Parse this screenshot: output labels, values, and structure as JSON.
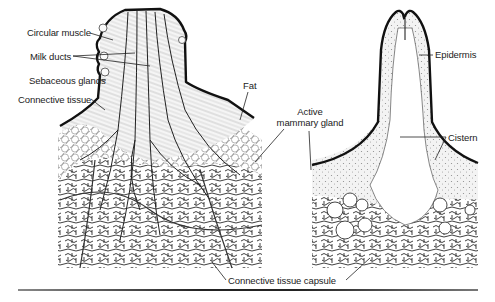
{
  "figure": {
    "left_panel": {
      "title": "Udder with teat (cross-section)",
      "labels": [
        {
          "id": "circular-muscle",
          "text": "Circular muscle",
          "x": 27,
          "y": 27
        },
        {
          "id": "milk-ducts",
          "text": "Milk ducts",
          "x": 30,
          "y": 51
        },
        {
          "id": "sebaceous-glands",
          "text": "Sebaceous glands",
          "x": 29,
          "y": 75
        },
        {
          "id": "connective-tissue",
          "text": "Connective tissue",
          "x": 18,
          "y": 94
        },
        {
          "id": "fat",
          "text": "Fat",
          "x": 243,
          "y": 80
        }
      ]
    },
    "right_panel": {
      "title": "Teat with cistern (cross-section)",
      "labels": [
        {
          "id": "epidermis",
          "text": "Epidermis",
          "x": 435,
          "y": 49
        },
        {
          "id": "cistern",
          "text": "Cistern",
          "x": 448,
          "y": 133
        }
      ]
    },
    "shared_labels": [
      {
        "id": "active-mammary-gland",
        "line1": "Active",
        "line2": "mammary gland",
        "x": 274,
        "y": 106
      },
      {
        "id": "connective-tissue-capsule",
        "text": "Connective tissue capsule",
        "x": 228,
        "y": 275
      }
    ],
    "colors": {
      "ink": "#1a1a1a",
      "outline": "#111111",
      "tissue_fill": "#f1f1f1",
      "background": "#ffffff"
    }
  }
}
